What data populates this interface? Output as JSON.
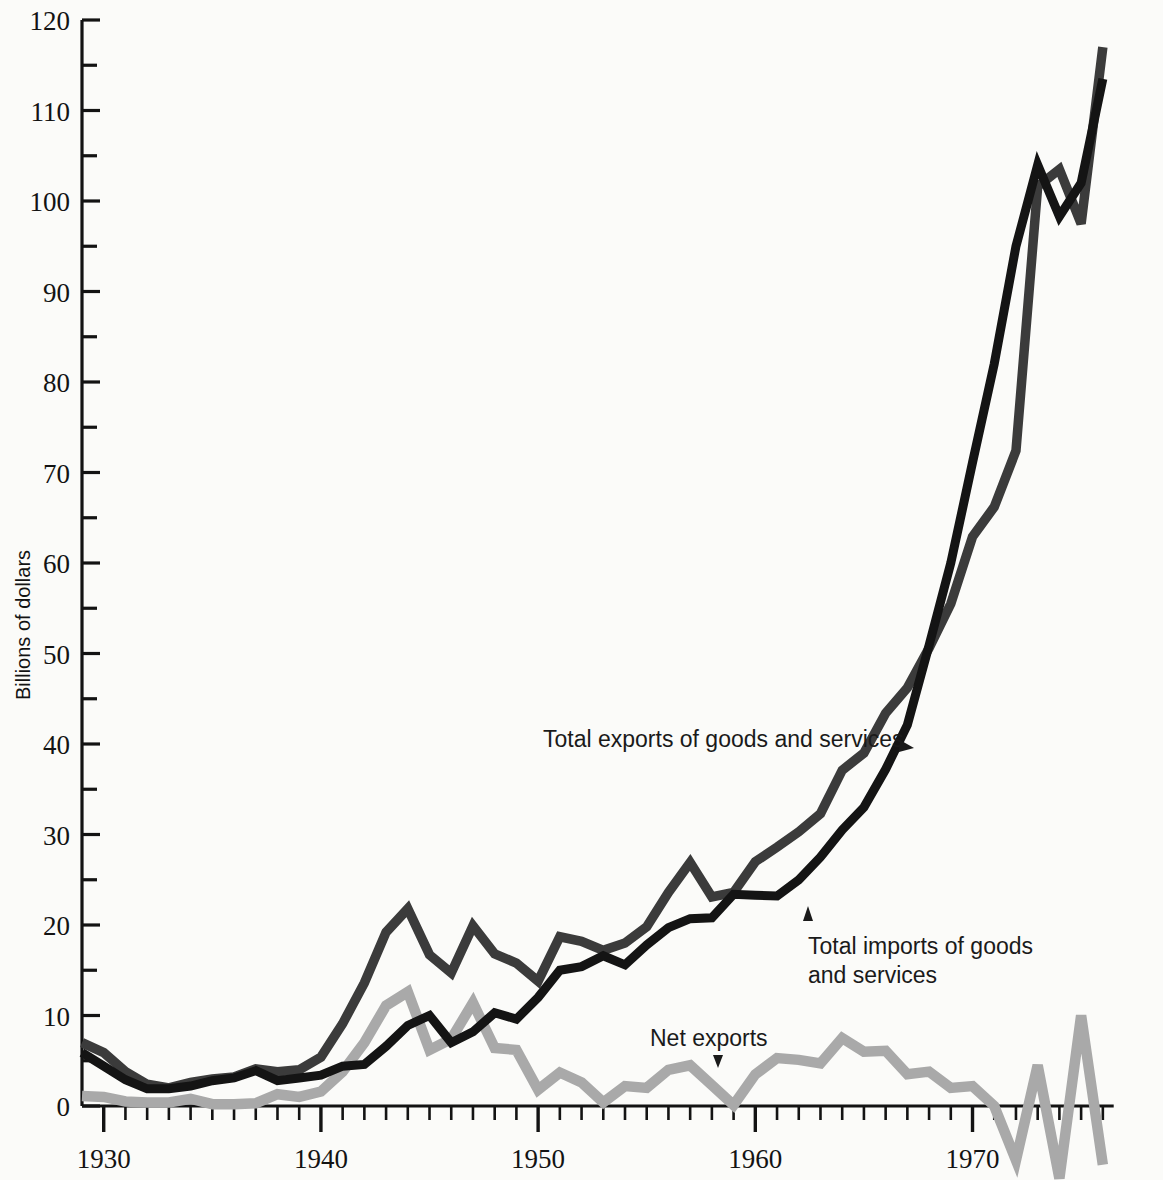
{
  "chart_data": {
    "type": "line",
    "title": "",
    "xlabel": "",
    "ylabel": "Billions of dollars",
    "xlim": [
      1929,
      1976
    ],
    "ylim": [
      -10,
      120
    ],
    "grid": false,
    "legend_position": "inline-annotations",
    "y_ticks_major": [
      0,
      10,
      20,
      30,
      40,
      50,
      60,
      70,
      80,
      90,
      100,
      110,
      120
    ],
    "y_ticks_minor": [
      5,
      15,
      25,
      35,
      45,
      55,
      65,
      75,
      85,
      95,
      105,
      115
    ],
    "y_tick_labels": [
      "0",
      "10",
      "20",
      "30",
      "40",
      "50",
      "60",
      "70",
      "80",
      "90",
      "100",
      "110",
      "120"
    ],
    "x_ticks_major": [
      1930,
      1940,
      1950,
      1960,
      1970
    ],
    "x_tick_labels": [
      "1930",
      "1940",
      "1950",
      "1960",
      "1970"
    ],
    "x_tick_minor_interval": 1,
    "x": [
      1929,
      1930,
      1931,
      1932,
      1933,
      1934,
      1935,
      1936,
      1937,
      1938,
      1939,
      1940,
      1941,
      1942,
      1943,
      1944,
      1945,
      1946,
      1947,
      1948,
      1949,
      1950,
      1951,
      1952,
      1953,
      1954,
      1955,
      1956,
      1957,
      1958,
      1959,
      1960,
      1961,
      1962,
      1963,
      1964,
      1965,
      1966,
      1967,
      1968,
      1969,
      1970,
      1971,
      1972,
      1973,
      1974,
      1975,
      1976
    ],
    "series": [
      {
        "name": "Total exports of goods and services",
        "color": "#3b3b3b",
        "values": [
          7.0,
          5.9,
          3.8,
          2.4,
          2.0,
          2.6,
          3.0,
          3.2,
          4.1,
          3.8,
          4.0,
          4.9,
          5.5,
          4.4,
          4.0,
          5.8,
          7.1,
          14.8,
          19.8,
          16.9,
          15.8,
          13.8,
          18.7,
          18.2,
          17.2,
          18.0,
          19.8,
          23.6,
          26.9,
          23.1,
          23.6,
          27.0,
          28.6,
          30.3,
          32.3,
          37.1,
          39.0,
          43.4,
          46.2,
          50.6,
          55.5,
          62.9,
          66.2,
          72.4,
          101.6,
          137.9,
          147.3,
          163.0
        ],
        "series_values_plot": [
          7.0,
          5.9,
          3.8,
          2.4,
          2.0,
          2.6,
          3.0,
          3.2,
          4.1,
          3.8,
          4.0,
          5.4,
          9.1,
          13.6,
          19.2,
          21.8,
          16.7,
          14.7,
          19.9,
          16.8,
          15.8,
          13.8,
          18.7,
          18.2,
          17.2,
          18.0,
          19.8,
          23.6,
          26.9,
          23.1,
          23.6,
          27.0,
          28.6,
          30.3,
          32.3,
          37.1,
          39.0,
          43.4,
          46.2,
          50.6,
          55.5,
          62.9,
          66.2,
          72.4,
          101.6,
          103.5,
          97.5,
          117.0
        ]
      },
      {
        "name": "Total imports of goods and services",
        "color": "#141414",
        "values": [
          5.9,
          4.4,
          2.9,
          1.9,
          1.9,
          2.2,
          2.8,
          3.1,
          3.9,
          2.8,
          3.1,
          3.4,
          4.4,
          4.6,
          6.6,
          8.9,
          10.0,
          7.0,
          8.2,
          10.3,
          9.6,
          12.0,
          15.0,
          15.9,
          16.6,
          16.5,
          17.8,
          19.7,
          20.7,
          20.8,
          22.8,
          22.8,
          22.7,
          25.0,
          26.1,
          28.1,
          31.5,
          37.1,
          39.9,
          46.6,
          50.5,
          55.8,
          62.3,
          74.2,
          91.2,
          127.5,
          122.7,
          151.1
        ],
        "series_values_plot": [
          5.9,
          4.4,
          2.9,
          1.9,
          1.9,
          2.2,
          2.8,
          3.1,
          3.9,
          2.8,
          3.1,
          3.4,
          4.4,
          4.6,
          6.6,
          8.9,
          10.0,
          7.0,
          8.2,
          10.3,
          9.6,
          12.0,
          15.0,
          15.4,
          16.6,
          15.6,
          17.8,
          19.7,
          20.7,
          20.8,
          23.4,
          23.3,
          23.2,
          25.0,
          27.5,
          30.5,
          33.0,
          37.2,
          42.1,
          50.9,
          60.0,
          71.1,
          82.0,
          95.0,
          104.0,
          98.3,
          102.0,
          113.5
        ]
      },
      {
        "name": "Net exports",
        "color": "#a9a9a9",
        "values": [
          1.1,
          1.0,
          0.5,
          0.4,
          0.4,
          0.8,
          0.2,
          0.2,
          0.3,
          1.3,
          1.0,
          1.5,
          1.1,
          -0.2,
          -2.2,
          -1.8,
          -0.8,
          7.5,
          11.5,
          6.5,
          6.2,
          1.8,
          3.7,
          2.2,
          0.4,
          1.8,
          2.0,
          4.0,
          5.8,
          2.2,
          0.1,
          4.2,
          5.5,
          5.1,
          5.9,
          8.5,
          6.9,
          5.3,
          5.2,
          2.5,
          1.9,
          3.9,
          0.6,
          -3.6,
          7.1,
          5.6,
          22.8,
          8.5
        ],
        "series_values_plot": [
          1.1,
          1.0,
          0.5,
          0.4,
          0.4,
          0.8,
          0.2,
          0.2,
          0.3,
          1.3,
          1.0,
          1.6,
          3.8,
          7.0,
          11.1,
          12.6,
          6.2,
          7.4,
          11.4,
          6.4,
          6.2,
          1.8,
          3.7,
          2.6,
          0.4,
          2.2,
          2.0,
          4.0,
          4.5,
          2.3,
          0.1,
          3.5,
          5.3,
          5.1,
          4.7,
          7.5,
          6.0,
          6.1,
          3.5,
          3.8,
          2.0,
          2.2,
          0.0,
          -6.0,
          4.5,
          -8.0,
          10.0,
          -6.5
        ]
      }
    ],
    "annotations": [
      {
        "id": "exports-annotation",
        "text": "Total exports of goods and services",
        "arrow": "right"
      },
      {
        "id": "imports-annotation",
        "line1": "Total imports of goods",
        "line2": "and services",
        "arrow": "up"
      },
      {
        "id": "net-exports-annotation",
        "text": "Net exports",
        "arrow": "down"
      }
    ]
  },
  "axes": {
    "y_axis_title": "Billions of dollars"
  }
}
